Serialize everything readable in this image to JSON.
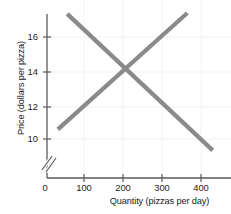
{
  "chart_data": {
    "type": "line",
    "title": "",
    "xlabel": "Quantity (pizzas per day)",
    "ylabel": "Price (dollars per pizza)",
    "xlim": [
      0,
      460
    ],
    "ylim": [
      9.0,
      17.4
    ],
    "y_axis_break": true,
    "grid": true,
    "legend_position": "none",
    "xticks": [
      {
        "value": 0,
        "label": "0"
      },
      {
        "value": 100,
        "label": "100"
      },
      {
        "value": 200,
        "label": "200"
      },
      {
        "value": 300,
        "label": "300"
      },
      {
        "value": 400,
        "label": "400"
      }
    ],
    "yticks": [
      {
        "value": 10,
        "label": "10"
      },
      {
        "value": 12,
        "label": "12"
      },
      {
        "value": 14,
        "label": "14"
      },
      {
        "value": 16,
        "label": "16"
      }
    ],
    "series": [
      {
        "name": "demand",
        "color": "#8a8a8a",
        "points": [
          {
            "x": 57,
            "y": 17.15
          },
          {
            "x": 430,
            "y": 9.35
          }
        ]
      },
      {
        "name": "supply",
        "color": "#8a8a8a",
        "points": [
          {
            "x": 33,
            "y": 10.55
          },
          {
            "x": 365,
            "y": 17.2
          }
        ]
      }
    ],
    "equilibrium": {
      "x": 200,
      "y": 14
    },
    "line_color": "#8a8a8a",
    "axis_color": "#5a5a5a",
    "grid_color": "#f0f0f0",
    "text_color": "#1b1b1b"
  }
}
